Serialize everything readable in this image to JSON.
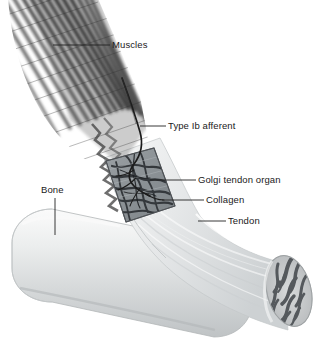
{
  "figure": {
    "background_color": "#ffffff",
    "label_color": "#1a1a1a",
    "leader_color": "#222222"
  },
  "labels": {
    "muscles": "Muscles",
    "type_ib_afferent": "Type Ib afferent",
    "golgi_tendon_organ": "Golgi tendon organ",
    "collagen": "Collagen",
    "tendon": "Tendon",
    "bone": "Bone"
  },
  "structures": {
    "muscle": {
      "name": "Muscles",
      "description": "Fan of diagonally striated muscle fibers entering from upper left, terminating in a jagged zigzag edge at the muscle-tendon junction",
      "fiber_color": "#565656",
      "fiber_count": 26
    },
    "nerve": {
      "name": "Type Ib afferent",
      "description": "Dark S-curved afferent nerve descending from upper middle into the Golgi tendon organ capsule",
      "color": "#1e1e1e"
    },
    "golgi_organ": {
      "name": "Golgi tendon organ",
      "description": "Rectangular cut-away window in the tendon showing branching collagen bundles encapsulated with nerve endings",
      "fill_color": "#8e9296"
    },
    "collagen": {
      "name": "Collagen",
      "description": "Interwoven collagen fiber bundles inside the Golgi tendon organ capsule",
      "color": "#3f4246"
    },
    "tendon": {
      "name": "Tendon",
      "description": "Pale fibrous tendon running from the muscle junction down to the right, cut transversely at the distal end",
      "color": "#e3e5e6"
    },
    "bone": {
      "name": "Bone",
      "description": "Smooth light-gray cylinder with rounded proximal end running diagonally across the lower half",
      "color": "#dcdedf"
    },
    "cut_end": {
      "name": "tendon cut surface",
      "description": "Elliptical transverse section at the distal tendon showing dark radiating fascicle pattern",
      "color": "#6c7075"
    }
  }
}
